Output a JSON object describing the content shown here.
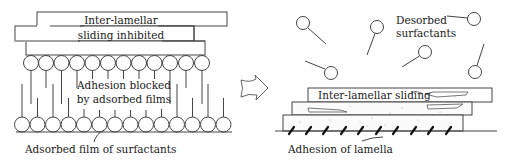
{
  "figure": {
    "left_panel": {
      "name": "adsorbed-state",
      "plate_label_line1": "Inter-lamellar",
      "plate_label_line2": "sliding inhibited",
      "middle_label_line1": "Adhesion blocked",
      "middle_label_line2": "by adsorbed films",
      "bottom_label": "Adsorbed film of surfactants"
    },
    "transition_arrow": {
      "icon": "hollow-right-arrow-icon"
    },
    "right_panel": {
      "name": "desorbed-state",
      "desorbed_label_line1": "Desorbed",
      "desorbed_label_line2": "surfactants",
      "sliding_label": "Inter-lamellar sliding",
      "bottom_label": "Adhesion of lamella"
    },
    "colors": {
      "stroke": "#444444",
      "text": "#1a1a1a",
      "background": "#ffffff",
      "adhesion_mark": "#111111"
    }
  }
}
